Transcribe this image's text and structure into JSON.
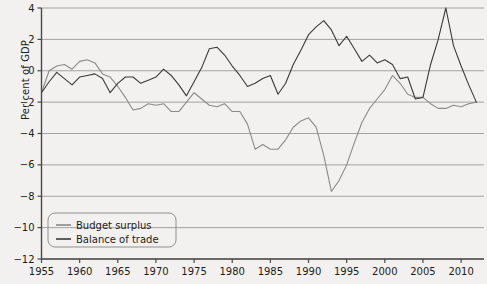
{
  "chart_data": {
    "type": "line",
    "title": "",
    "xlabel": "",
    "ylabel": "Per cent of GDP",
    "xlim": [
      1955,
      2013
    ],
    "ylim": [
      -12,
      4
    ],
    "yticks": [
      4,
      2,
      0,
      -2,
      -4,
      -6,
      -8,
      -10,
      -12
    ],
    "ytick_labels": [
      "4",
      "2",
      "0",
      "−2",
      "−4",
      "−6",
      "−8",
      "−10",
      "−12"
    ],
    "xticks": [
      1955,
      1960,
      1965,
      1970,
      1975,
      1980,
      1985,
      1990,
      1995,
      2000,
      2005,
      2010
    ],
    "xtick_labels": [
      "1955",
      "1960",
      "1965",
      "1970",
      "1975",
      "1980",
      "1985",
      "1990",
      "1995",
      "2000",
      "2005",
      "2010"
    ],
    "grid": "horizontal",
    "legend_position": "lower-left",
    "colors": {
      "budget_surplus": "#8a8a8a",
      "balance_of_trade": "#3a3a3a",
      "grid": "#9a9a9a",
      "axis": "#4a4a4a",
      "background": "#f2f1ef",
      "text": "#1c1c1c"
    },
    "series": [
      {
        "name": "Budget surplus",
        "color": "#8a8a8a",
        "x": [
          1955,
          1956,
          1957,
          1958,
          1959,
          1960,
          1961,
          1962,
          1963,
          1964,
          1965,
          1966,
          1967,
          1968,
          1969,
          1970,
          1971,
          1972,
          1973,
          1974,
          1975,
          1976,
          1977,
          1978,
          1979,
          1980,
          1981,
          1982,
          1983,
          1984,
          1985,
          1986,
          1987,
          1988,
          1989,
          1990,
          1991,
          1992,
          1993,
          1994,
          1995,
          1996,
          1997,
          1998,
          1999,
          2000,
          2001,
          2002,
          2003,
          2004,
          2005,
          2006,
          2007,
          2008,
          2009,
          2010,
          2011,
          2012
        ],
        "values": [
          -1.4,
          0.0,
          0.3,
          0.4,
          0.1,
          0.6,
          0.7,
          0.5,
          -0.2,
          -0.4,
          -1.0,
          -1.7,
          -2.5,
          -2.4,
          -2.1,
          -2.2,
          -2.1,
          -2.6,
          -2.6,
          -2.0,
          -1.4,
          -1.8,
          -2.2,
          -2.3,
          -2.1,
          -2.6,
          -2.6,
          -3.4,
          -5.0,
          -4.7,
          -5.0,
          -5.0,
          -4.4,
          -3.6,
          -3.2,
          -3.0,
          -3.6,
          -5.4,
          -7.7,
          -7.0,
          -6.0,
          -4.6,
          -3.3,
          -2.4,
          -1.8,
          -1.2,
          -0.3,
          -0.8,
          -1.5,
          -1.7,
          -1.7,
          -2.1,
          -2.4,
          -2.4,
          -2.2,
          -2.3,
          -2.1,
          -2.0
        ],
        "units": "per cent of GDP"
      },
      {
        "name": "Balance of trade",
        "color": "#3a3a3a",
        "x": [
          1955,
          1956,
          1957,
          1958,
          1959,
          1960,
          1961,
          1962,
          1963,
          1964,
          1965,
          1966,
          1967,
          1968,
          1969,
          1970,
          1971,
          1972,
          1973,
          1974,
          1975,
          1976,
          1977,
          1978,
          1979,
          1980,
          1981,
          1982,
          1983,
          1984,
          1985,
          1986,
          1987,
          1988,
          1989,
          1990,
          1991,
          1992,
          1993,
          1994,
          1995,
          1996,
          1997,
          1998,
          1999,
          2000,
          2001,
          2002,
          2003,
          2004,
          2005,
          2006,
          2007,
          2008,
          2009,
          2010,
          2011,
          2012
        ],
        "values": [
          -1.4,
          -0.7,
          -0.1,
          -0.5,
          -0.9,
          -0.4,
          -0.3,
          -0.2,
          -0.5,
          -1.4,
          -0.8,
          -0.4,
          -0.4,
          -0.8,
          -0.6,
          -0.4,
          0.1,
          -0.3,
          -0.9,
          -1.6,
          -0.7,
          0.2,
          1.4,
          1.5,
          1.0,
          0.3,
          -0.3,
          -1.0,
          -0.8,
          -0.5,
          -0.3,
          -1.5,
          -0.8,
          0.4,
          1.3,
          2.3,
          2.8,
          3.2,
          2.6,
          1.6,
          2.2,
          1.4,
          0.6,
          1.0,
          0.5,
          0.7,
          0.4,
          -0.5,
          -0.4,
          -1.8,
          -1.7,
          0.4,
          2.0,
          4.0,
          1.6,
          0.3,
          -0.9,
          -2.0
        ],
        "units": "per cent of GDP"
      }
    ],
    "annotations": [
      {
        "label": "budget deficit trough",
        "x": 1993,
        "y": -7.7,
        "series": "Budget surplus"
      },
      {
        "label": "budget deficit trough (GFC)",
        "x": 2010,
        "y": -11.0,
        "series": "Budget surplus"
      },
      {
        "label": "trade balance peak",
        "x": 2008,
        "y": 4.0,
        "series": "Balance of trade"
      }
    ]
  },
  "legend": {
    "items": [
      {
        "label": "Budget surplus",
        "color": "#8a8a8a"
      },
      {
        "label": "Balance of trade",
        "color": "#3a3a3a"
      }
    ]
  }
}
